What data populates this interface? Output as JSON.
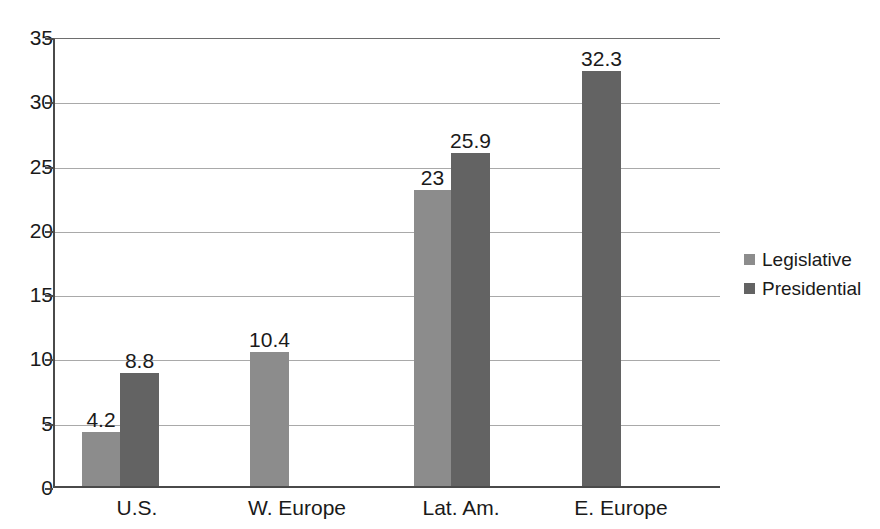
{
  "chart_data": {
    "type": "bar",
    "title": "",
    "subtitle": "",
    "xlabel": "",
    "ylabel": "",
    "categories": [
      "U.S.",
      "W. Europe",
      "Lat. Am.",
      "E. Europe"
    ],
    "series": [
      {
        "name": "Legislative",
        "color": "#8c8c8c",
        "values": [
          4.2,
          10.4,
          23,
          null
        ],
        "labels": [
          "4.2",
          "10.4",
          "23",
          ""
        ]
      },
      {
        "name": "Presidential",
        "color": "#636363",
        "values": [
          8.8,
          null,
          25.9,
          32.3
        ],
        "labels": [
          "8.8",
          "",
          "25.9",
          "32.3"
        ]
      }
    ],
    "ylim": [
      0,
      35
    ],
    "yticks": [
      0,
      5,
      10,
      15,
      20,
      25,
      30,
      35
    ],
    "ytick_labels": [
      "0",
      "5",
      "10",
      "15",
      "20",
      "25",
      "30",
      "35"
    ],
    "grid": true,
    "grid_axis": "y",
    "legend_position": "right",
    "legend_entries": [
      "Legislative",
      "Presidential"
    ],
    "data_labels_shown": true,
    "bar_layout": [
      {
        "category": "U.S.",
        "series": "Legislative",
        "value": 4.2,
        "label": "4.2",
        "x": 80,
        "width": 38
      },
      {
        "category": "U.S.",
        "series": "Presidential",
        "value": 8.8,
        "label": "8.8",
        "x": 118,
        "width": 39
      },
      {
        "category": "W. Europe",
        "series": "Legislative",
        "value": 10.4,
        "label": "10.4",
        "x": 248,
        "width": 39
      },
      {
        "category": "Lat. Am.",
        "series": "Legislative",
        "value": 23,
        "label": "23",
        "x": 412,
        "width": 37
      },
      {
        "category": "Lat. Am.",
        "series": "Presidential",
        "value": 25.9,
        "label": "25.9",
        "x": 449,
        "width": 39
      },
      {
        "category": "E. Europe",
        "series": "Presidential",
        "value": 32.3,
        "label": "32.3",
        "x": 580,
        "width": 39
      }
    ],
    "category_label_x": [
      137,
      297,
      461,
      621
    ]
  },
  "colors": {
    "legislative": "#8c8c8c",
    "presidential": "#636363",
    "axis": "#4a4a4a",
    "grid": "#a9a9a9",
    "text": "#1a1a1a",
    "background": "#ffffff"
  }
}
